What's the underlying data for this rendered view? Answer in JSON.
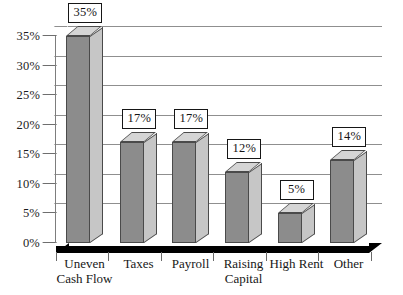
{
  "chart_data": {
    "type": "bar",
    "title": "",
    "subtitle": "",
    "xlabel": "",
    "ylabel": "",
    "ylim": [
      0,
      35
    ],
    "ytick_values": [
      0,
      5,
      10,
      15,
      20,
      25,
      30,
      35
    ],
    "ytick_labels": [
      "0%",
      "5%",
      "10%",
      "15%",
      "20%",
      "25%",
      "30%",
      "35%"
    ],
    "grid": true,
    "legend": false,
    "legend_position": "none",
    "style": "3d-column",
    "categories": [
      "Uneven Cash Flow",
      "Taxes",
      "Payroll",
      "Raising Capital",
      "High Rent",
      "Other"
    ],
    "category_lines": [
      [
        "Uneven",
        "Cash Flow"
      ],
      [
        "Taxes",
        ""
      ],
      [
        "Payroll",
        ""
      ],
      [
        "Raising",
        "Capital"
      ],
      [
        "High Rent",
        ""
      ],
      [
        "Other",
        ""
      ]
    ],
    "values": [
      35,
      17,
      17,
      12,
      5,
      14
    ],
    "data_labels": [
      "35%",
      "17%",
      "17%",
      "12%",
      "5%",
      "14%"
    ],
    "colors": {
      "bar_front": "#8c8c8c",
      "bar_side": "#c6c6c6",
      "bar_top": "#d5d5d5",
      "bar_outline": "#4a4a4a",
      "gridline": "#8f8f8f",
      "axis": "#7d7d7d",
      "floor": "#000000",
      "label_box_border": "#161616",
      "label_box_fill": "#ffffff",
      "text": "#171717",
      "background": "#ffffff"
    }
  }
}
